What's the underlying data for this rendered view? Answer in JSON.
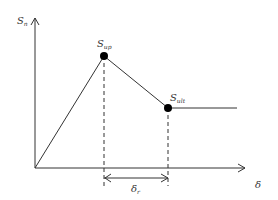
{
  "diagram": {
    "type": "stress-slip curve",
    "colors": {
      "line": "#333333",
      "point": "#000000",
      "background": "#ffffff"
    },
    "axes": {
      "y": {
        "symbol": "S",
        "subscript": "n"
      },
      "x": {
        "symbol": "δ",
        "subscript": ""
      }
    },
    "points": [
      {
        "id": "peak",
        "symbol": "S",
        "subscript": "up"
      },
      {
        "id": "residual",
        "symbol": "S",
        "subscript": "ult"
      }
    ],
    "dimension": {
      "symbol": "δ",
      "subscript": "r"
    }
  }
}
